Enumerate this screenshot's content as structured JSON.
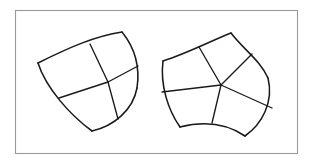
{
  "figure": {
    "title": "Two curvilinear polygons with subdivided cells",
    "background_color": "#ffffff",
    "frame": {
      "name": "outer-border",
      "x": 15,
      "y": 10,
      "width": 282,
      "height": 143,
      "stroke_color": "#9a9a9a",
      "stroke_width": 1.1,
      "fill_color": "#ffffff"
    },
    "stroke_color": "#1a1a1a",
    "outline_stroke_width": 1.55,
    "interior_stroke_width": 1.35
  },
  "chart_data": {
    "type": "diagram",
    "title": "Two curvilinear polygons with subdivided cells",
    "grid": false,
    "legend": null,
    "xlabel": "",
    "ylabel": "",
    "xlim": [
      0,
      313
    ],
    "ylim": [
      0,
      163
    ],
    "shapes": [
      {
        "name": "left-figure",
        "description": "Curvilinear triangle-like region with concave arcs, subdivided into 3 quadrilateral cells meeting at one interior vertex",
        "cusp_count": 4,
        "cell_count": 3,
        "cusps": [
          {
            "label": "west-cusp",
            "x": 38,
            "y": 63
          },
          {
            "label": "north-cusp",
            "x": 122,
            "y": 32
          },
          {
            "label": "east-cusp",
            "x": 137,
            "y": 88
          },
          {
            "label": "south-cusp",
            "x": 92,
            "y": 131
          }
        ],
        "interior_vertex": {
          "label": "center",
          "x": 108,
          "y": 82
        },
        "boundary_arcs": [
          {
            "from": "west-cusp",
            "to": "north-cusp",
            "bulge": "concave-up",
            "via": [
              68,
              48,
              95,
              36
            ]
          },
          {
            "from": "north-cusp",
            "to": "east-cusp",
            "bulge": "convex-right",
            "via": [
              135,
              48,
              140,
              68
            ]
          },
          {
            "from": "east-cusp",
            "to": "south-cusp",
            "bulge": "convex-right",
            "via": [
              133,
              110,
              114,
              126
            ]
          },
          {
            "from": "south-cusp",
            "to": "west-cusp",
            "bulge": "concave-right",
            "via": [
              70,
              115,
              46,
              88
            ]
          }
        ],
        "boundary_midpoints": [
          {
            "label": "nw-edge-mid",
            "x": 90,
            "y": 44
          },
          {
            "label": "ne-edge-mid",
            "x": 138,
            "y": 66
          },
          {
            "label": "se-edge-mid",
            "x": 118,
            "y": 119
          },
          {
            "label": "sw-edge-mid",
            "x": 59,
            "y": 98
          }
        ],
        "interior_edges": [
          {
            "from": "nw-edge-mid",
            "to": "center"
          },
          {
            "from": "ne-edge-mid",
            "to": "center"
          },
          {
            "from": "se-edge-mid",
            "to": "center"
          },
          {
            "from": "sw-edge-mid",
            "to": "center"
          }
        ]
      },
      {
        "name": "right-figure",
        "description": "Curvilinear pentagon-like region with concave arcs, subdivided into 5 quadrilateral cells meeting at one interior vertex",
        "cusp_count": 5,
        "cell_count": 5,
        "cusps": [
          {
            "label": "west-cusp",
            "x": 163,
            "y": 61
          },
          {
            "label": "north-cusp",
            "x": 231,
            "y": 33
          },
          {
            "label": "east-cusp",
            "x": 268,
            "y": 78
          },
          {
            "label": "southeast-cusp",
            "x": 245,
            "y": 136
          },
          {
            "label": "southwest-cusp",
            "x": 180,
            "y": 127
          }
        ],
        "interior_vertex": {
          "label": "center",
          "x": 221,
          "y": 85
        },
        "boundary_arcs": [
          {
            "from": "west-cusp",
            "to": "north-cusp",
            "bulge": "concave",
            "via": [
              188,
              53,
              213,
              40
            ]
          },
          {
            "from": "north-cusp",
            "to": "east-cusp",
            "bulge": "concave",
            "via": [
              244,
              50,
              260,
              60
            ]
          },
          {
            "from": "east-cusp",
            "to": "southeast-cusp",
            "bulge": "convex",
            "via": [
              274,
              102,
              262,
              124
            ]
          },
          {
            "from": "southeast-cusp",
            "to": "southwest-cusp",
            "bulge": "concave",
            "via": [
              224,
              122,
              200,
              122
            ]
          },
          {
            "from": "southwest-cusp",
            "to": "west-cusp",
            "bulge": "concave",
            "via": [
              168,
              110,
              160,
              85
            ]
          }
        ],
        "boundary_midpoints": [
          {
            "label": "n-edge-mid",
            "x": 199,
            "y": 47
          },
          {
            "label": "ne-edge-mid",
            "x": 252,
            "y": 54
          },
          {
            "label": "e-edge-mid",
            "x": 272,
            "y": 108
          },
          {
            "label": "s-edge-mid",
            "x": 212,
            "y": 123
          },
          {
            "label": "w-edge-mid",
            "x": 162,
            "y": 92
          }
        ],
        "interior_edges": [
          {
            "from": "n-edge-mid",
            "to": "center"
          },
          {
            "from": "ne-edge-mid",
            "to": "center"
          },
          {
            "from": "e-edge-mid",
            "to": "center"
          },
          {
            "from": "s-edge-mid",
            "to": "center"
          },
          {
            "from": "w-edge-mid",
            "to": "center"
          }
        ]
      }
    ]
  }
}
